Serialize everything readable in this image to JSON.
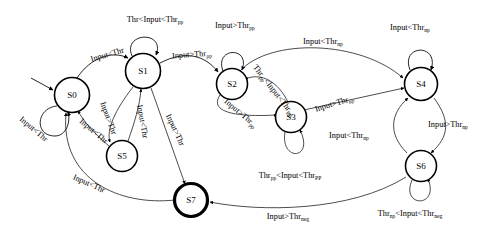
{
  "diagram": {
    "type": "state-transition-diagram",
    "width": 482,
    "height": 238,
    "colors": {
      "background": "#ffffff",
      "stroke": "#000000",
      "state_fill": "#ffffff"
    },
    "thresholds": [
      "Thr",
      "Thr_pp",
      "Thr_PP",
      "Thr_np",
      "Thr_neg"
    ],
    "states": [
      {
        "id": "S0",
        "label": "S0",
        "cx": 72,
        "cy": 95,
        "r": 17.5,
        "accepting": false,
        "initial": true
      },
      {
        "id": "S1",
        "label": "S1",
        "cx": 143,
        "cy": 71,
        "r": 17.5,
        "accepting": false,
        "initial": false
      },
      {
        "id": "S2",
        "label": "S2",
        "cx": 232,
        "cy": 84,
        "r": 15.5,
        "accepting": false,
        "initial": false
      },
      {
        "id": "S3",
        "label": "S3",
        "cx": 291,
        "cy": 117,
        "r": 15.5,
        "accepting": false,
        "initial": false
      },
      {
        "id": "S4",
        "label": "S4",
        "cx": 421,
        "cy": 84,
        "r": 16.5,
        "accepting": false,
        "initial": false
      },
      {
        "id": "S5",
        "label": "S5",
        "cx": 122,
        "cy": 156,
        "r": 15.5,
        "accepting": false,
        "initial": false
      },
      {
        "id": "S6",
        "label": "S6",
        "cx": 421,
        "cy": 166,
        "r": 15.5,
        "accepting": false,
        "initial": false
      },
      {
        "id": "S7",
        "label": "S7",
        "cx": 191,
        "cy": 200,
        "r": 16.5,
        "accepting": true,
        "initial": false
      }
    ],
    "transitions": [
      {
        "from": "S0",
        "to": "S0",
        "label": "Input<Thr",
        "base": "Input<Thr",
        "sub": "",
        "kind": "self"
      },
      {
        "from": "S0",
        "to": "S1",
        "label": "Input<Thr",
        "base": "Input<Thr",
        "sub": "",
        "kind": "curve"
      },
      {
        "from": "S1",
        "to": "S1",
        "label": "Thr<Input<Thr_pp",
        "base": "Thr<Input<Thr",
        "sub": "pp",
        "kind": "self"
      },
      {
        "from": "S1",
        "to": "S2",
        "label": "Input>Thr_pp",
        "base": "Input>Thr",
        "sub": "pp",
        "kind": "curve"
      },
      {
        "from": "S1",
        "to": "S5",
        "label": "Input<Thr",
        "base": "Input<Thr",
        "sub": "",
        "kind": "curve"
      },
      {
        "from": "S5",
        "to": "S1",
        "label": "Input>Thr",
        "base": "Input>Thr",
        "sub": "",
        "kind": "curve"
      },
      {
        "from": "S5",
        "to": "S0",
        "label": "Input<Thr",
        "base": "Input<Thr",
        "sub": "",
        "kind": "curve"
      },
      {
        "from": "S2",
        "to": "S2",
        "label": "Input>Thr_pp",
        "base": "Input>Thr",
        "sub": "pp",
        "kind": "self"
      },
      {
        "from": "S2",
        "to": "S3",
        "label": "Input>Thr_pp",
        "base": "Input>Thr",
        "sub": "pp",
        "kind": "curve"
      },
      {
        "from": "S3",
        "to": "S2",
        "label": "Thr_pp<Input<Thr_PP",
        "base": "Thr",
        "sub": "pp",
        "kind": "curve"
      },
      {
        "from": "S3",
        "to": "S3",
        "label": "Thr_pp<Input<Thr_PP",
        "base": "Thr",
        "sub": "pp",
        "kind": "self"
      },
      {
        "from": "S2",
        "to": "S4",
        "label": "Input<Thr_np",
        "base": "Input<Thr",
        "sub": "np",
        "kind": "curve"
      },
      {
        "from": "S3",
        "to": "S4",
        "label": "Input>Thr_np",
        "base": "Input>Thr",
        "sub": "np",
        "kind": "curve"
      },
      {
        "from": "S4",
        "to": "S4",
        "label": "Input<Thr_np",
        "base": "Input<Thr",
        "sub": "np",
        "kind": "self"
      },
      {
        "from": "S4",
        "to": "S6",
        "label": "Input>Thr_np",
        "base": "Input>Thr",
        "sub": "np",
        "kind": "curve"
      },
      {
        "from": "S6",
        "to": "S4",
        "label": "Input<Thr_np",
        "base": "Input<Thr",
        "sub": "np",
        "kind": "curve"
      },
      {
        "from": "S6",
        "to": "S6",
        "label": "Thr_np<Input<Thr_neg",
        "base": "Thr",
        "sub": "np",
        "kind": "self"
      },
      {
        "from": "S6",
        "to": "S7",
        "label": "Input>Thr_neg",
        "base": "Input>Thr",
        "sub": "neg",
        "kind": "curve"
      },
      {
        "from": "S1",
        "to": "S7",
        "label": "Input>Thr",
        "base": "Input>Thr",
        "sub": "",
        "kind": "curve"
      },
      {
        "from": "S7",
        "to": "S0",
        "label": "Input<Thr",
        "base": "Input<Thr",
        "sub": "",
        "kind": "curve"
      }
    ],
    "labels": [
      {
        "id": "lbl-s1-self",
        "base": "Thr<Input<Thr",
        "sub": "pp",
        "tail": "",
        "sub2": "",
        "x": 155,
        "y": 22,
        "rot": 0
      },
      {
        "id": "lbl-s2-self",
        "base": "Input>Thr",
        "sub": "pp",
        "tail": "",
        "sub2": "",
        "x": 235,
        "y": 28,
        "rot": 0
      },
      {
        "id": "lbl-s4-self",
        "base": "Input<Thr",
        "sub": "np",
        "tail": "",
        "sub2": "",
        "x": 410,
        "y": 30,
        "rot": 0
      },
      {
        "id": "lbl-s0-s1",
        "base": "Input<Thr",
        "sub": "",
        "tail": "",
        "sub2": "",
        "x": 108,
        "y": 57,
        "rot": -16
      },
      {
        "id": "lbl-s1-s2",
        "base": "Input>Thr",
        "sub": "pp",
        "tail": "",
        "sub2": "",
        "x": 192,
        "y": 57,
        "rot": -4
      },
      {
        "id": "lbl-s2-s4",
        "base": "Input<Thr",
        "sub": "np",
        "tail": "",
        "sub2": "",
        "x": 323,
        "y": 44,
        "rot": 0
      },
      {
        "id": "lbl-s3-s2",
        "base": "Thr",
        "sub": "pp",
        "tail": "<Input<Thr",
        "sub2": "PP",
        "x": 272,
        "y": 92,
        "rot": 52
      },
      {
        "id": "lbl-s3-s4",
        "base": "Input>Thr",
        "sub": "np",
        "tail": "",
        "sub2": "",
        "x": 335,
        "y": 106,
        "rot": -17
      },
      {
        "id": "lbl-s2-s3",
        "base": "Input>Thr",
        "sub": "pp",
        "tail": "",
        "sub2": "",
        "x": 239,
        "y": 115,
        "rot": 40
      },
      {
        "id": "lbl-s6-s4",
        "base": "Input<Thr",
        "sub": "np",
        "tail": "",
        "sub2": "",
        "x": 349,
        "y": 138,
        "rot": 0
      },
      {
        "id": "lbl-s4-s6",
        "base": "Input>Thr",
        "sub": "np",
        "tail": "",
        "sub2": "",
        "x": 448,
        "y": 127,
        "rot": 0
      },
      {
        "id": "lbl-s3-self",
        "base": "Thr",
        "sub": "pp",
        "tail": "<Input<Thr",
        "sub2": "PP",
        "x": 290,
        "y": 178,
        "rot": 0
      },
      {
        "id": "lbl-s6-self",
        "base": "Thr",
        "sub": "np",
        "tail": "<Input<Thr",
        "sub2": "neg",
        "x": 410,
        "y": 216,
        "rot": 0
      },
      {
        "id": "lbl-s0-self",
        "base": "Input<Thr",
        "sub": "",
        "tail": "",
        "sub2": "",
        "x": 32,
        "y": 131,
        "rot": 40
      },
      {
        "id": "lbl-s1-s5",
        "base": "Input>Thr",
        "sub": "",
        "tail": "",
        "sub2": "",
        "x": 106,
        "y": 119,
        "rot": 70
      },
      {
        "id": "lbl-s5-s1",
        "base": "Input<Thr",
        "sub": "",
        "tail": "",
        "sub2": "",
        "x": 140,
        "y": 122,
        "rot": 80
      },
      {
        "id": "lbl-s5-s0",
        "base": "Input<Thr",
        "sub": "",
        "tail": "",
        "sub2": "",
        "x": 92,
        "y": 133,
        "rot": 40
      },
      {
        "id": "lbl-s1-s7",
        "base": "Input>Thr",
        "sub": "",
        "tail": "",
        "sub2": "",
        "x": 173,
        "y": 131,
        "rot": 65
      },
      {
        "id": "lbl-s7-s0",
        "base": "Input<Thr",
        "sub": "",
        "tail": "",
        "sub2": "",
        "x": 88,
        "y": 186,
        "rot": 24
      },
      {
        "id": "lbl-s6-s7",
        "base": "Input>Thr",
        "sub": "neg",
        "tail": "",
        "sub2": "",
        "x": 288,
        "y": 219,
        "rot": 0
      }
    ]
  }
}
